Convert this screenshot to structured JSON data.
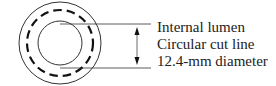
{
  "diagram": {
    "labels": {
      "internal_lumen": "Internal lumen",
      "cut_line": "Circular cut line",
      "diameter": "12.4-mm diameter"
    },
    "colors": {
      "stroke": "#222222",
      "background": "#ffffff"
    }
  }
}
